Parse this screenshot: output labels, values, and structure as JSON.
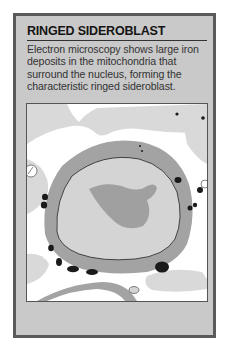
{
  "card": {
    "title": "RINGED SIDEROBLAST",
    "description": "Electron microscopy shows large iron deposits in the mitochondria that surround the nucleus, forming the characteristic ringed sideroblast."
  },
  "figure": {
    "colors": {
      "background": "#ffffff",
      "cytoplasm_light": "#d9d9d9",
      "ring": "#a3a3a3",
      "nucleus": "#d4d4d4",
      "nucleolus": "#a0a0a0",
      "iron_deposit": "#1a1a1a",
      "frame": "#5a5a5a",
      "card_bg": "#c9c9c9"
    }
  }
}
